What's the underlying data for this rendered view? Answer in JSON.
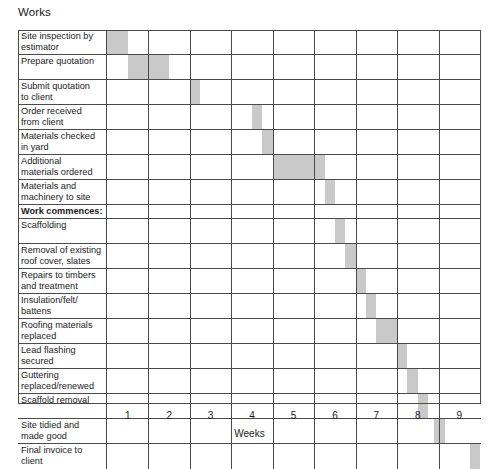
{
  "title": "Works",
  "axis": {
    "label": "Weeks",
    "ticks": [
      "1",
      "2",
      "3",
      "4",
      "5",
      "6",
      "7",
      "8",
      "9"
    ]
  },
  "colors": {
    "bar": "#c9c9c9",
    "grid": "#4a4a4a",
    "background": "#ffffff",
    "text": "#1b1b1b"
  },
  "chart_data": {
    "type": "bar",
    "title": "Works",
    "xlabel": "Weeks",
    "ylabel": "",
    "xlim": [
      0,
      9
    ],
    "grid": true,
    "legend": null,
    "categories": [
      "Site inspection by estimator",
      "Prepare quotation",
      "Submit quotation to client",
      "Order received from client",
      "Materials checked in yard",
      "Additional materials ordered",
      "Materials and machinery to site",
      "Work commences:",
      "Scaffolding",
      "Removal of existing roof cover, slates etc",
      "Repairs to timbers and treatment",
      "Insulation/felt/battens",
      "Roofing materials replaced",
      "Lead flashing secured",
      "Guttering replaced/renewed",
      "Scaffold removal",
      "Site tidied and made good",
      "Final invoice to client"
    ],
    "tasks": [
      {
        "label": "Site inspection by estimator",
        "start": 0.0,
        "end": 0.5,
        "header": false
      },
      {
        "label": "Prepare quotation",
        "start": 0.5,
        "end": 1.5,
        "header": false
      },
      {
        "label": "Submit quotation to client",
        "start": 2.0,
        "end": 2.25,
        "header": false
      },
      {
        "label": "Order received from client",
        "start": 3.5,
        "end": 3.75,
        "header": false
      },
      {
        "label": "Materials checked in yard",
        "start": 3.75,
        "end": 4.0,
        "header": false
      },
      {
        "label": "Additional materials ordered",
        "start": 4.0,
        "end": 5.25,
        "header": false
      },
      {
        "label": "Materials and machinery to site",
        "start": 5.25,
        "end": 5.5,
        "header": false
      },
      {
        "label": "Work commences:",
        "start": null,
        "end": null,
        "header": true
      },
      {
        "label": "Scaffolding",
        "start": 5.5,
        "end": 5.75,
        "header": false
      },
      {
        "label": "Removal of existing roof cover, slates etc",
        "start": 5.75,
        "end": 6.0,
        "header": false
      },
      {
        "label": "Repairs to timbers and treatment",
        "start": 6.0,
        "end": 6.25,
        "header": false
      },
      {
        "label": "Insulation/felt/battens",
        "start": 6.25,
        "end": 6.5,
        "header": false
      },
      {
        "label": "Roofing materials replaced",
        "start": 6.5,
        "end": 7.0,
        "header": false
      },
      {
        "label": "Lead flashing secured",
        "start": 7.0,
        "end": 7.25,
        "header": false
      },
      {
        "label": "Guttering replaced/renewed",
        "start": 7.25,
        "end": 7.5,
        "header": false
      },
      {
        "label": "Scaffold removal",
        "start": 7.5,
        "end": 7.75,
        "header": false
      },
      {
        "label": "Site tidied and made good",
        "start": 7.9,
        "end": 8.15,
        "header": false
      },
      {
        "label": "Final invoice to client",
        "start": 8.75,
        "end": 9.0,
        "header": false
      }
    ]
  },
  "rows": [
    {
      "id": "site-inspection",
      "lines": [
        "Site inspection by",
        "estimator"
      ],
      "bold": false,
      "height": 25
    },
    {
      "id": "prepare-quotation",
      "lines": [
        "Prepare quotation"
      ],
      "bold": false,
      "height": 25
    },
    {
      "id": "submit-quotation",
      "lines": [
        "Submit quotation",
        "to client"
      ],
      "bold": false,
      "height": 25
    },
    {
      "id": "order-received",
      "lines": [
        "Order received",
        "from client"
      ],
      "bold": false,
      "height": 25
    },
    {
      "id": "materials-checked",
      "lines": [
        "Materials checked",
        "in yard"
      ],
      "bold": false,
      "height": 25
    },
    {
      "id": "additional-materials",
      "lines": [
        "Additional",
        "materials ordered"
      ],
      "bold": false,
      "height": 25
    },
    {
      "id": "materials-machinery",
      "lines": [
        "Materials and",
        "machinery to site"
      ],
      "bold": false,
      "height": 25
    },
    {
      "id": "work-commences",
      "lines": [
        "Work commences:"
      ],
      "bold": true,
      "height": 14
    },
    {
      "id": "scaffolding",
      "lines": [
        "Scaffolding"
      ],
      "bold": false,
      "height": 25
    },
    {
      "id": "removal-roof-cover",
      "lines": [
        "Removal of existing",
        "roof cover, slates etc"
      ],
      "bold": false,
      "height": 25
    },
    {
      "id": "repairs-timbers",
      "lines": [
        "Repairs to timbers",
        "and treatment"
      ],
      "bold": false,
      "height": 25
    },
    {
      "id": "insulation-felt",
      "lines": [
        "Insulation/felt/",
        "battens"
      ],
      "bold": false,
      "height": 25
    },
    {
      "id": "roofing-materials",
      "lines": [
        "Roofing materials",
        "replaced"
      ],
      "bold": false,
      "height": 25
    },
    {
      "id": "lead-flashing",
      "lines": [
        "Lead flashing",
        "secured"
      ],
      "bold": false,
      "height": 25
    },
    {
      "id": "guttering",
      "lines": [
        "Guttering",
        "replaced/renewed"
      ],
      "bold": false,
      "height": 25
    },
    {
      "id": "scaffold-removal",
      "lines": [
        "Scaffold removal"
      ],
      "bold": false,
      "height": 25
    },
    {
      "id": "site-tidied",
      "lines": [
        "Site tidied and",
        "made good"
      ],
      "bold": false,
      "height": 25
    },
    {
      "id": "final-invoice",
      "lines": [
        "Final invoice to",
        "client"
      ],
      "bold": false,
      "height": 25
    }
  ]
}
